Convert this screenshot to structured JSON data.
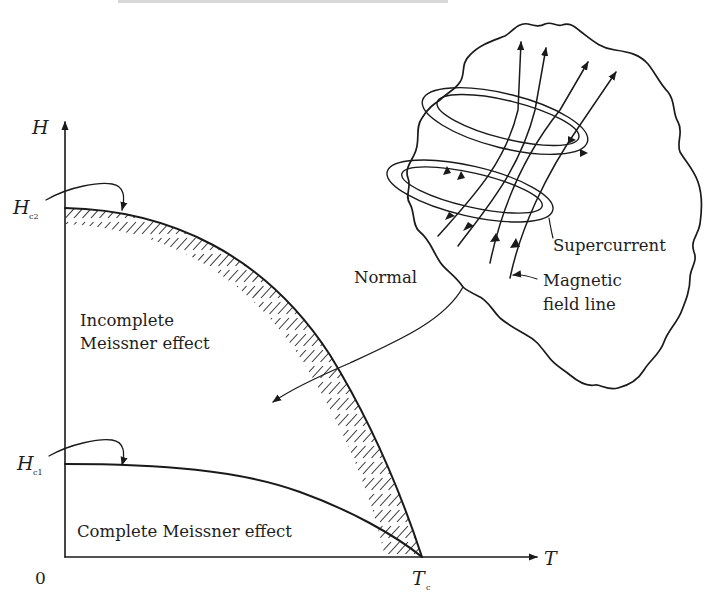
{
  "figure": {
    "title": "",
    "axes": {
      "y_label": "H",
      "x_label": "T",
      "origin_label": "0",
      "tc_label": "T",
      "tc_subscript": "c",
      "hc2_label": "H",
      "hc2_subscript": "c2",
      "hc1_label": "H",
      "hc1_subscript": "c1"
    },
    "regions": {
      "incomplete_line1": "Incomplete",
      "incomplete_line2": "Meissner effect",
      "complete": "Complete Meissner effect",
      "normal": "Normal"
    },
    "inset": {
      "supercurrent_label": "Supercurrent",
      "field_line_label_line1": "Magnetic",
      "field_line_label_line2": "field line",
      "field_line_count": 4,
      "supercurrent_loop_count": 2
    },
    "colors": {
      "ink": "#1a1a1a",
      "background": "#ffffff"
    }
  },
  "chart_data": {
    "type": "line",
    "title": "",
    "xlabel": "T",
    "ylabel": "H",
    "x_ticks": [
      "0",
      "Tc"
    ],
    "y_ticks": [
      "Hc1",
      "Hc2"
    ],
    "series": [
      {
        "name": "Hc2(T)",
        "x": [
          0,
          0.25,
          0.5,
          0.75,
          1.0
        ],
        "values": [
          1.0,
          0.94,
          0.75,
          0.44,
          0.0
        ]
      },
      {
        "name": "Hc1(T)",
        "x": [
          0,
          0.25,
          0.5,
          0.75,
          1.0
        ],
        "values": [
          0.27,
          0.25,
          0.2,
          0.12,
          0.0
        ]
      }
    ],
    "annotations": [
      "Incomplete Meissner effect",
      "Complete Meissner effect",
      "Normal",
      "Supercurrent",
      "Magnetic field line"
    ],
    "grid": false,
    "legend": "none"
  }
}
